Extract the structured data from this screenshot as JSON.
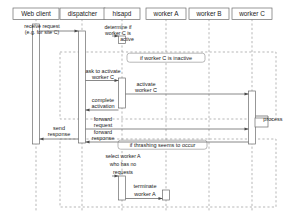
{
  "diagram": {
    "kind": "uml-sequence-diagram",
    "colors": {
      "background": "#ffffff",
      "stroke": "#6b6b6b",
      "lifeline": "#8a8a8a",
      "text": "#1a1a1a",
      "activation_fill": "#ffffff",
      "fragment_stroke": "#8a8a8a"
    },
    "lifelines": [
      {
        "id": "web-client",
        "label": "Web client",
        "x": 36,
        "box_w": 46
      },
      {
        "id": "dispatcher",
        "label": "dispatcher",
        "x": 82,
        "box_w": 45
      },
      {
        "id": "hisapd",
        "label": "hisapd",
        "x": 122,
        "box_w": 36
      },
      {
        "id": "worker-a",
        "label": "worker A",
        "x": 166,
        "box_w": 40
      },
      {
        "id": "worker-b",
        "label": "worker B",
        "x": 209,
        "box_w": 40
      },
      {
        "id": "worker-c",
        "label": "worker C",
        "x": 252,
        "box_w": 40
      }
    ],
    "fragments": [
      {
        "id": "fragment-inactive",
        "label": "if worker C is inactive",
        "x": 60,
        "y": 52,
        "w": 216,
        "h": 67,
        "label_w": 77,
        "label_h": 9
      },
      {
        "id": "fragment-thrashing",
        "label": "if thrashing seems to occur",
        "x": 60,
        "y": 139,
        "w": 216,
        "h": 68,
        "label_w": 88,
        "label_h": 9
      }
    ],
    "notes": [
      {
        "id": "note-receive-request",
        "lines": [
          "receive request",
          "(e.g. for site C)"
        ],
        "x": 36,
        "y": 26
      },
      {
        "id": "note-determine-active",
        "lines": [
          "determine if",
          "worker C is",
          "active"
        ],
        "x": 122,
        "y": 26
      },
      {
        "id": "note-select-worker",
        "lines": [
          "select worker A",
          "who has no",
          "requests"
        ],
        "x": 122,
        "y": 154
      }
    ],
    "messages": [
      {
        "id": "msg-receive-request",
        "label": "",
        "from": "web-client",
        "to": "dispatcher",
        "y": 24,
        "style": "solid"
      },
      {
        "id": "msg-ask-activate",
        "lines": [
          "ask to activate",
          "worker C"
        ],
        "from": "dispatcher",
        "to": "hisapd",
        "y": 78,
        "style": "solid"
      },
      {
        "id": "msg-activate-worker-c",
        "lines": [
          "activate",
          "worker C"
        ],
        "from": "hisapd",
        "to": "worker-c",
        "y": 91,
        "style": "solid"
      },
      {
        "id": "msg-complete-activation",
        "lines": [
          "complete",
          "activation"
        ],
        "from": "hisapd",
        "to": "dispatcher",
        "y": 107,
        "style": "solid"
      },
      {
        "id": "msg-forward-request",
        "lines": [
          "forward",
          "request"
        ],
        "from": "dispatcher",
        "to": "worker-c",
        "y": 126,
        "style": "solid"
      },
      {
        "id": "msg-forward-response",
        "lines": [
          "forward",
          "response"
        ],
        "from": "worker-c",
        "to": "dispatcher",
        "y": 143,
        "style": "solid"
      },
      {
        "id": "msg-send-response",
        "lines": [
          "send",
          "response"
        ],
        "from": "dispatcher",
        "to": "web-client",
        "y": 137,
        "style": "solid"
      },
      {
        "id": "msg-terminate-worker-a",
        "lines": [
          "terminate",
          "worker A"
        ],
        "from": "hisapd",
        "to": "worker-a",
        "y": 190,
        "style": "solid"
      },
      {
        "id": "msg-process",
        "label": "process",
        "from": "worker-c",
        "to": "worker-c",
        "y": 124,
        "style": "self"
      }
    ],
    "labels": {
      "process": "process",
      "send_response_l1": "send",
      "send_response_l2": "response",
      "forward_request_l1": "forward",
      "forward_request_l2": "request",
      "forward_response_l1": "forward",
      "forward_response_l2": "response",
      "ask_activate_l1": "ask to activate",
      "ask_activate_l2": "worker C",
      "activate_l1": "activate",
      "activate_l2": "worker C",
      "complete_l1": "complete",
      "complete_l2": "activation",
      "terminate_l1": "terminate",
      "terminate_l2": "worker A",
      "receive_l1": "receive request",
      "receive_l2": "(e.g. for site C)",
      "determine_l1": "determine if",
      "determine_l2": "worker C is",
      "determine_l3": "active",
      "select_l1": "select worker A",
      "select_l2": "who has no",
      "select_l3": "requests",
      "frag_inactive": "if worker C is inactive",
      "frag_thrashing": "if thrashing seems to occur"
    }
  }
}
